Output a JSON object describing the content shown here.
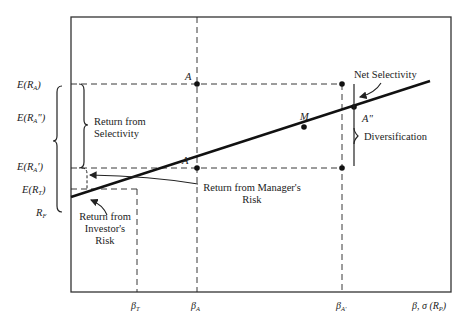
{
  "diagram": {
    "type": "security-market-line-performance-decomposition",
    "colors": {
      "ink": "#1a1a1a",
      "frame": "#333333",
      "background": "#ffffff"
    },
    "y_axis_labels": [
      {
        "id": "E_RA",
        "main": "E(R",
        "sub": "A",
        "tail": ")"
      },
      {
        "id": "E_RA2",
        "main": "E(R",
        "sub": "A",
        "tail": "\")"
      },
      {
        "id": "E_RA1",
        "main": "E(R",
        "sub": "A",
        "tail": "')"
      },
      {
        "id": "E_RT",
        "main": "E(R",
        "sub": "T",
        "tail": ")"
      },
      {
        "id": "RF",
        "main": "R",
        "sub": "F",
        "tail": ""
      }
    ],
    "x_axis_labels": [
      {
        "id": "beta_T",
        "main": "β",
        "sub": "T"
      },
      {
        "id": "beta_A",
        "main": "β",
        "sub": "A"
      },
      {
        "id": "beta_A1",
        "main": "β",
        "sub": "A'"
      },
      {
        "id": "axis_title",
        "main": "β, σ (R",
        "sub": "P",
        "tail": ")"
      }
    ],
    "points": [
      {
        "id": "A",
        "label": "A"
      },
      {
        "id": "A1",
        "label": "A'"
      },
      {
        "id": "A2",
        "label": "A\""
      },
      {
        "id": "M",
        "label": "M"
      }
    ],
    "annotations": {
      "return_from_selectivity": [
        "Return from",
        "Selectivity"
      ],
      "return_from_investors_risk": [
        "Return from",
        "Investor's",
        "Risk"
      ],
      "return_from_managers_risk": [
        "Return from Manager's",
        "Risk"
      ],
      "net_selectivity": "Net Selectivity",
      "diversification": "Diversification"
    }
  }
}
